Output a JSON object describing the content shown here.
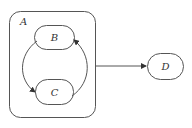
{
  "diagram": {
    "type": "statechart",
    "colors": {
      "stroke": "#444444",
      "background": "#ffffff",
      "text": "#333333"
    },
    "nodes": [
      {
        "id": "A",
        "label": "A",
        "kind": "composite-state"
      },
      {
        "id": "B",
        "label": "B",
        "kind": "state",
        "parent": "A"
      },
      {
        "id": "C",
        "label": "C",
        "kind": "state",
        "parent": "A"
      },
      {
        "id": "D",
        "label": "D",
        "kind": "state"
      }
    ],
    "edges": [
      {
        "from": "B",
        "to": "C"
      },
      {
        "from": "C",
        "to": "B"
      },
      {
        "from": "A",
        "to": "D"
      }
    ]
  }
}
